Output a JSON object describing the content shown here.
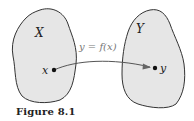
{
  "figure": {
    "caption": "Figure 8.1",
    "set_x_label": "X",
    "set_y_label": "Y",
    "point_x_label": "x",
    "point_y_label": "y",
    "mapping_label": "y = f(x)"
  },
  "colors": {
    "blob_fill": "#e6e6e6",
    "blob_stroke": "#333333",
    "arrow": "#555555",
    "text": "#222222",
    "mapping_text": "#777777"
  }
}
